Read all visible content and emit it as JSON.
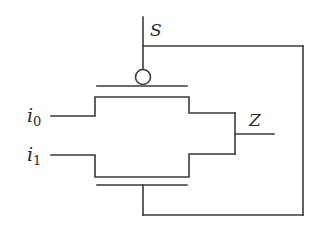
{
  "diagram": {
    "type": "2:1 multiplexer using transmission gate",
    "labels": {
      "select": "S",
      "output": "Z",
      "input0_base": "i",
      "input0_sub": "0",
      "input1_base": "i",
      "input1_sub": "1"
    },
    "colors": {
      "line": "#3a3a3a",
      "background": "#ffffff"
    }
  }
}
